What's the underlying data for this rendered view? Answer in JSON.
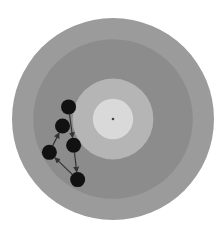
{
  "target": {
    "rings": [
      {
        "name": "outer",
        "radius_fraction": 1.0,
        "color": "#9b9b9b"
      },
      {
        "name": "middle-dark",
        "radius_fraction": 0.79,
        "color": "#8c8c8c"
      },
      {
        "name": "inner-light",
        "radius_fraction": 0.4,
        "color": "#b5b5b5"
      },
      {
        "name": "center",
        "radius_fraction": 0.2,
        "color": "#d9d9d9"
      }
    ],
    "center_mark_color": "#444444"
  },
  "shots": [
    {
      "id": 1,
      "x": -0.44,
      "y": -0.12
    },
    {
      "id": 2,
      "x": -0.5,
      "y": 0.07
    },
    {
      "id": 3,
      "x": -0.39,
      "y": 0.26
    },
    {
      "id": 4,
      "x": -0.63,
      "y": 0.33
    },
    {
      "id": 5,
      "x": -0.35,
      "y": 0.6
    }
  ],
  "sequence": [
    1,
    3,
    5,
    4,
    2
  ],
  "shot_color": "#111111",
  "arrow_color": "#333333"
}
